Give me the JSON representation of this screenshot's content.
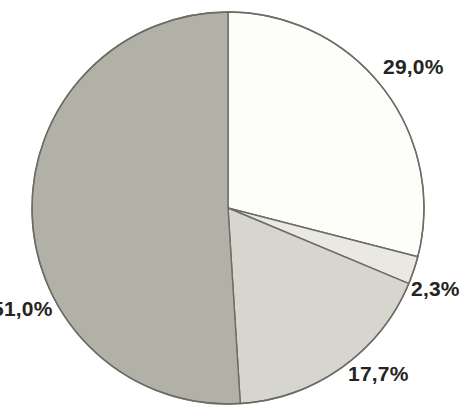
{
  "chart_data": {
    "type": "pie",
    "title": "",
    "subtitle": "",
    "xlabel": "",
    "ylabel": "",
    "legend": "none",
    "grid": false,
    "start_angle_deg": 0,
    "direction": "clockwise",
    "total_percent": 100.0,
    "decimal_separator": ",",
    "categories": [
      "Segment 1",
      "Segment 2",
      "Segment 3",
      "Segment 4"
    ],
    "values": [
      29.0,
      2.3,
      17.7,
      51.0
    ],
    "labels": [
      "29,0%",
      "2,3%",
      "17,7%",
      "51,0%"
    ],
    "slices": [
      {
        "name": "slice-white",
        "label": "29,0%",
        "value": 29.0,
        "color": "#fdfdfa",
        "start_deg": 0.0,
        "end_deg": 104.4,
        "label_clipped": false
      },
      {
        "name": "slice-sliver",
        "label": "2,3%",
        "value": 2.3,
        "color": "#e9e9e2",
        "start_deg": 104.4,
        "end_deg": 112.68,
        "label_clipped": false
      },
      {
        "name": "slice-light-gray",
        "label": "17,7%",
        "value": 17.7,
        "color": "#d6d6ce",
        "start_deg": 112.68,
        "end_deg": 176.4,
        "label_clipped": false
      },
      {
        "name": "slice-gray",
        "label": "51,0%",
        "value": 51.0,
        "color": "#b1b1a7",
        "start_deg": 176.4,
        "end_deg": 360.0,
        "label_clipped": true
      }
    ],
    "geometry": {
      "center_x": 228,
      "center_y": 208,
      "radius": 196
    },
    "colors": {
      "background": "#ffffff",
      "outline": "#6d6d66",
      "text": "#242422"
    }
  }
}
